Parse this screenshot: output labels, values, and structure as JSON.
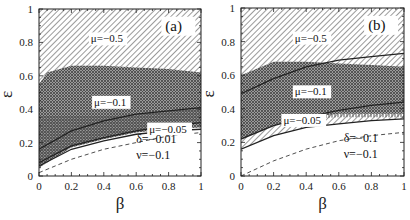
{
  "chart_data": [
    {
      "type": "area",
      "panel_label": "(a)",
      "title": "",
      "xlabel": "β",
      "ylabel": "ε",
      "xlim": [
        0,
        1
      ],
      "ylim": [
        0,
        1
      ],
      "xticks": [
        "0",
        "0.2",
        "0.4",
        "0.6",
        "0.8",
        "1"
      ],
      "yticks": [
        "0",
        "0.2",
        "0.4",
        "0.6",
        "0.8",
        "1"
      ],
      "parameters": [
        "δ=−0.01",
        "ν=−0.1"
      ],
      "regions": [
        {
          "name": "μ=−0.5",
          "pattern": "diagonal",
          "label_pos": [
            0.32,
            0.8
          ],
          "upper": {
            "x": [
              0,
              1
            ],
            "y": [
              1,
              1
            ]
          },
          "lower": {
            "x": [
              0,
              0.2,
              0.4,
              0.6,
              0.8,
              1
            ],
            "y": [
              0.06,
              0.19,
              0.24,
              0.27,
              0.28,
              0.29
            ]
          }
        },
        {
          "name": "μ=−0.1",
          "pattern": "cross",
          "label_pos": [
            0.34,
            0.42
          ],
          "upper": {
            "x": [
              0,
              0.05,
              0.2,
              0.4,
              0.6,
              0.8,
              1
            ],
            "y": [
              0.55,
              0.62,
              0.66,
              0.66,
              0.65,
              0.64,
              0.62
            ]
          },
          "lower": {
            "x": [
              0,
              0.2,
              0.4,
              0.6,
              0.8,
              1
            ],
            "y": [
              0.05,
              0.17,
              0.22,
              0.26,
              0.28,
              0.29
            ]
          }
        },
        {
          "name": "μ=−0.05",
          "pattern": "vertical",
          "label_pos": [
            0.68,
            0.26
          ],
          "upper": {
            "x": [
              0,
              0.2,
              0.4,
              0.6,
              0.8,
              1
            ],
            "y": [
              0.36,
              0.36,
              0.36,
              0.37,
              0.39,
              0.41
            ]
          },
          "lower": {
            "x": [
              0,
              0.2,
              0.4,
              0.6,
              0.8,
              1
            ],
            "y": [
              0.07,
              0.18,
              0.24,
              0.27,
              0.3,
              0.32
            ]
          }
        }
      ],
      "curves": [
        {
          "name": "upper solid",
          "style": "solid",
          "x": [
            0,
            0.2,
            0.4,
            0.6,
            0.8,
            1
          ],
          "y": [
            0.16,
            0.27,
            0.33,
            0.37,
            0.39,
            0.41
          ]
        },
        {
          "name": "middle solid",
          "style": "solid",
          "x": [
            0,
            0.2,
            0.4,
            0.6,
            0.8,
            1
          ],
          "y": [
            0.08,
            0.18,
            0.23,
            0.27,
            0.3,
            0.32
          ]
        },
        {
          "name": "lower solid",
          "style": "solid",
          "x": [
            0,
            0.2,
            0.4,
            0.6,
            0.8,
            1
          ],
          "y": [
            0.06,
            0.16,
            0.21,
            0.25,
            0.27,
            0.28
          ]
        },
        {
          "name": "dashed",
          "style": "dashed",
          "x": [
            0,
            0.2,
            0.4,
            0.6,
            0.8,
            1
          ],
          "y": [
            0.02,
            0.1,
            0.16,
            0.2,
            0.24,
            0.26
          ]
        }
      ],
      "grid": false,
      "legend_position": "none"
    },
    {
      "type": "area",
      "panel_label": "(b)",
      "title": "",
      "xlabel": "β",
      "ylabel": "ε",
      "xlim": [
        0,
        1
      ],
      "ylim": [
        0,
        1
      ],
      "xticks": [
        "0",
        "0.2",
        "0.4",
        "0.6",
        "0.8",
        "1"
      ],
      "yticks": [
        "0",
        "0.2",
        "0.4",
        "0.6",
        "0.8",
        "1"
      ],
      "parameters": [
        "δ=−0.1",
        "ν=−0.1"
      ],
      "regions": [
        {
          "name": "μ=−0.5",
          "pattern": "diagonal",
          "label_pos": [
            0.33,
            0.8
          ],
          "upper": {
            "x": [
              0,
              1
            ],
            "y": [
              1,
              1
            ]
          },
          "lower": {
            "x": [
              0,
              0.2,
              0.4,
              0.6,
              0.8,
              1
            ],
            "y": [
              0.16,
              0.24,
              0.29,
              0.31,
              0.33,
              0.34
            ]
          }
        },
        {
          "name": "μ=−0.1",
          "pattern": "vertical",
          "label_pos": [
            0.33,
            0.48
          ],
          "upper": {
            "x": [
              0,
              0.2,
              0.4,
              0.6,
              0.8,
              1
            ],
            "y": [
              0.49,
              0.58,
              0.65,
              0.65,
              0.65,
              0.65
            ]
          },
          "lower": {
            "x": [
              0,
              0.2,
              0.4,
              0.6,
              0.8,
              1
            ],
            "y": [
              0.22,
              0.3,
              0.34,
              0.35,
              0.35,
              0.35
            ]
          }
        },
        {
          "name": "μ=−0.05",
          "pattern": "cross",
          "label_pos": [
            0.26,
            0.31
          ],
          "upper": {
            "x": [
              0,
              0.2,
              0.4,
              0.6,
              0.8,
              1
            ],
            "y": [
              0.6,
              0.68,
              0.68,
              0.67,
              0.66,
              0.65
            ]
          },
          "lower": {
            "x": [
              0,
              0.2,
              0.4,
              0.6,
              0.8,
              1
            ],
            "y": [
              0.22,
              0.3,
              0.35,
              0.37,
              0.37,
              0.37
            ]
          }
        }
      ],
      "curves": [
        {
          "name": "top solid",
          "style": "solid",
          "x": [
            0,
            0.2,
            0.4,
            0.6,
            0.8,
            1
          ],
          "y": [
            0.49,
            0.58,
            0.65,
            0.69,
            0.71,
            0.73
          ]
        },
        {
          "name": "middle solid",
          "style": "solid",
          "x": [
            0,
            0.2,
            0.4,
            0.6,
            0.8,
            1
          ],
          "y": [
            0.22,
            0.3,
            0.35,
            0.39,
            0.42,
            0.44
          ]
        },
        {
          "name": "lower solid",
          "style": "solid",
          "x": [
            0,
            0.2,
            0.4,
            0.6,
            0.8,
            1
          ],
          "y": [
            0.16,
            0.24,
            0.29,
            0.31,
            0.33,
            0.34
          ]
        },
        {
          "name": "dashed",
          "style": "dashed",
          "x": [
            0,
            0.2,
            0.4,
            0.6,
            0.8,
            1
          ],
          "y": [
            0.0,
            0.09,
            0.16,
            0.21,
            0.24,
            0.26
          ]
        }
      ],
      "grid": false,
      "legend_position": "none"
    }
  ],
  "layout": {
    "panels": [
      {
        "id": "a",
        "plot_box": {
          "x0": 39,
          "y0": 9,
          "x1": 201,
          "y1": 176
        }
      },
      {
        "id": "b",
        "plot_box": {
          "x0": 39,
          "y0": 8,
          "x1": 202,
          "y1": 176
        }
      }
    ],
    "colors": {
      "ink": "#222222",
      "background": "#ffffff",
      "pattern": "#555555"
    }
  }
}
